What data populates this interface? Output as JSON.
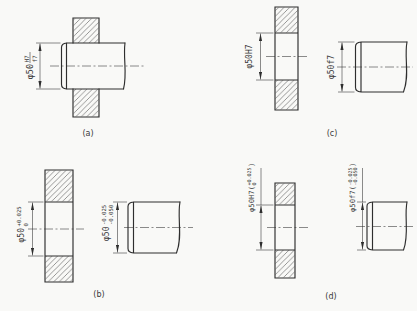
{
  "figure": {
    "background": "#f9f9f7",
    "line_color": "#2e2e2e",
    "text_color": "#3a3a3a"
  },
  "panels": {
    "a": {
      "label": "(a)",
      "fit_dimension": {
        "prefix": "φ50",
        "numerator": "H7",
        "denominator": "f7"
      }
    },
    "b": {
      "label": "(b)",
      "hole_dimension": {
        "prefix": "φ50",
        "upper": "+0.025",
        "lower": "0"
      },
      "shaft_dimension": {
        "prefix": "φ50",
        "upper": "-0.025",
        "lower": "-0.050"
      }
    },
    "c": {
      "label": "(c)",
      "hole_dimension": {
        "text": "φ50H7"
      },
      "shaft_dimension": {
        "text": "φ50f7"
      }
    },
    "d": {
      "label": "(d)",
      "hole_dimension": {
        "prefix": "φ50H7(",
        "upper": "+0.025",
        "lower": "0",
        "suffix": ")"
      },
      "shaft_dimension": {
        "prefix": "φ50f7(",
        "upper": "-0.025",
        "lower": "-0.050",
        "suffix": ")"
      }
    }
  }
}
